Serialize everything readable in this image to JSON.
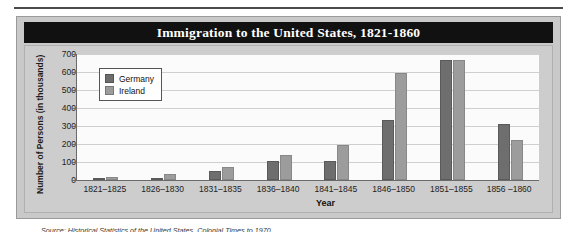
{
  "figure": {
    "title": "Immigration to the United States, 1821-1860",
    "source_note": "Source: Historical Statistics of the United States, Colonial Times to 1970",
    "colors": {
      "banner_background": "#111111",
      "banner_text": "#ffffff",
      "figure_background": "#c9c9c9",
      "panel_background": "#cdcdcd",
      "plot_background": "#fbfbfb",
      "germany": "#6e6e6e",
      "ireland": "#9c9c9c",
      "axis": "#6a6a6a",
      "gridline": "#cfcfcf"
    }
  },
  "chart_data": {
    "type": "bar",
    "title": "Immigration to the United States, 1821-1860",
    "xlabel": "Year",
    "ylabel": "Number of Persons (in thousands)",
    "ylim": [
      0,
      700
    ],
    "yticks": [
      0,
      100,
      200,
      300,
      400,
      500,
      600,
      700
    ],
    "ytick_labels": [
      "0",
      "100",
      "200",
      "300",
      "400",
      "500",
      "600",
      "700"
    ],
    "grid": true,
    "legend_position": "upper-left",
    "categories": [
      "1821–1825",
      "1826–1830",
      "1831–1835",
      "1836–1840",
      "1841–1845",
      "1846–1850",
      "1851–1855",
      "1856 –1860"
    ],
    "series": [
      {
        "name": "Germany",
        "color": "#6e6e6e",
        "values": [
          8,
          7,
          50,
          105,
          105,
          335,
          665,
          310
        ]
      },
      {
        "name": "Ireland",
        "color": "#9c9c9c",
        "values": [
          14,
          35,
          75,
          140,
          195,
          595,
          665,
          220
        ]
      }
    ]
  }
}
